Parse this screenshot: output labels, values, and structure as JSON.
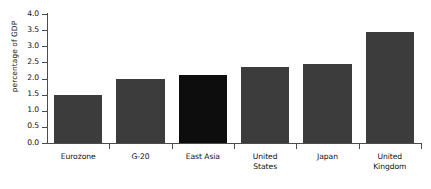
{
  "chart_data": {
    "type": "bar",
    "title": "",
    "xlabel": "",
    "ylabel": "percentage of GDP",
    "categories": [
      "Eurozone",
      "G-20",
      "East Asia",
      "United States",
      "Japan",
      "United Kingdom"
    ],
    "category_lines": [
      [
        "Eurozone"
      ],
      [
        "G-20"
      ],
      [
        "East Asia"
      ],
      [
        "United",
        "States"
      ],
      [
        "Japan"
      ],
      [
        "United",
        "Kingdom"
      ]
    ],
    "values": [
      1.5,
      2.0,
      2.1,
      2.35,
      2.45,
      3.45
    ],
    "highlight_index": 2,
    "ylim": [
      0.0,
      4.0
    ],
    "yticks": [
      "0.0",
      "0.5",
      "1.0",
      "1.5",
      "2.0",
      "2.5",
      "3.0",
      "3.5",
      "4.0"
    ],
    "ytick_values": [
      0.0,
      0.5,
      1.0,
      1.5,
      2.0,
      2.5,
      3.0,
      3.5,
      4.0
    ],
    "grid": false,
    "legend": "none",
    "colors": {
      "bar": "#3c3c3c",
      "bar_highlight": "#0d0d0d",
      "axis": "#4c4c4c",
      "text": "#111111",
      "background": "#ffffff"
    }
  }
}
